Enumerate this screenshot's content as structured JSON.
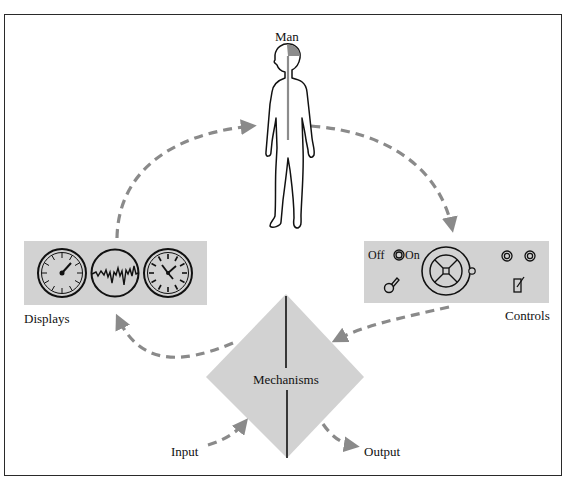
{
  "diagram": {
    "title": "Man",
    "nodes": {
      "man": {
        "label": "Man"
      },
      "displays": {
        "label": "Displays",
        "items": [
          "dial-gauge",
          "waveform-scope",
          "clock-gauge"
        ]
      },
      "controls": {
        "label": "Controls",
        "switch_off_label": "Off",
        "switch_on_label": "On",
        "items": [
          "off-on-switch",
          "handwheel",
          "lever-knob",
          "indicator-lamp-1",
          "indicator-lamp-2",
          "toggle-switch"
        ]
      },
      "mechanisms": {
        "label": "Mechanisms"
      },
      "input": {
        "label": "Input"
      },
      "output": {
        "label": "Output"
      }
    },
    "edges": [
      {
        "from": "displays",
        "to": "man"
      },
      {
        "from": "man",
        "to": "controls"
      },
      {
        "from": "controls",
        "to": "mechanisms"
      },
      {
        "from": "mechanisms",
        "to": "displays"
      },
      {
        "from": "input",
        "to": "mechanisms"
      },
      {
        "from": "mechanisms",
        "to": "output"
      }
    ],
    "colors": {
      "panel_fill": "#d2d2d2",
      "arrow": "#8a8a8a",
      "outline": "#111111",
      "brain": "#8c8c8c"
    }
  }
}
